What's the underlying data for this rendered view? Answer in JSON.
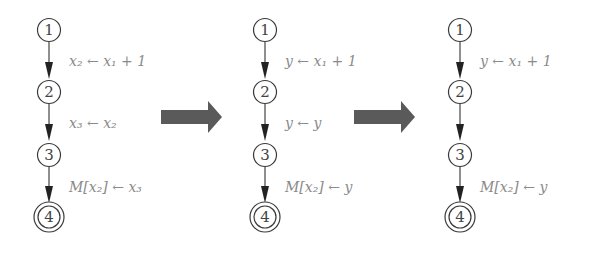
{
  "panels": [
    {
      "name": "original",
      "nodes": [
        "1",
        "2",
        "3",
        "4"
      ],
      "edges": [
        {
          "from": "1",
          "to": "2",
          "label": "x₂ ← x₁ + 1"
        },
        {
          "from": "2",
          "to": "3",
          "label": "x₃ ← x₂"
        },
        {
          "from": "3",
          "to": "4",
          "label": "M[x₂] ← x₃"
        }
      ]
    },
    {
      "name": "renamed",
      "nodes": [
        "1",
        "2",
        "3",
        "4"
      ],
      "edges": [
        {
          "from": "1",
          "to": "2",
          "label": "y ← x₁ + 1"
        },
        {
          "from": "2",
          "to": "3",
          "label": "y ← y"
        },
        {
          "from": "3",
          "to": "4",
          "label": "M[x₂] ← y"
        }
      ]
    },
    {
      "name": "simplified",
      "nodes": [
        "1",
        "2",
        "3",
        "4"
      ],
      "edges": [
        {
          "from": "1",
          "to": "2",
          "label": "y ← x₁ + 1"
        },
        {
          "from": "2",
          "to": "3",
          "label": ""
        },
        {
          "from": "3",
          "to": "4",
          "label": "M[x₂] ← y"
        }
      ]
    }
  ],
  "transitions": [
    {
      "from": "original",
      "to": "renamed",
      "icon": "right-arrow-icon"
    },
    {
      "from": "renamed",
      "to": "simplified",
      "icon": "right-arrow-icon"
    }
  ],
  "final_node": "4",
  "colors": {
    "node_stroke": "#3a3a3a",
    "label_text": "#8a8a8a",
    "transition_arrow": "#5a5a5a"
  }
}
